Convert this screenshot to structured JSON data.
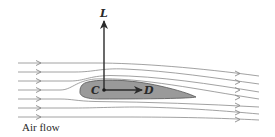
{
  "diagram": {
    "labels": {
      "lift": "L",
      "drag": "D",
      "center": "C",
      "flow": "Air flow"
    },
    "colors": {
      "airfoil_fill": "#9a9a9a",
      "airfoil_stroke": "#555555",
      "streamline": "#8a8a8a",
      "vector": "#2a2a2a"
    },
    "streamline_count": 7
  }
}
